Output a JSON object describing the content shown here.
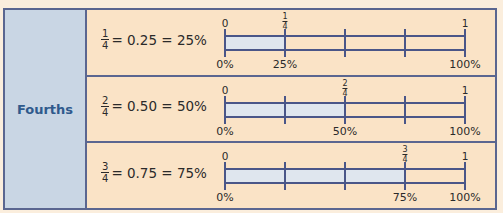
{
  "category_label": "Fourths",
  "rows": [
    {
      "fraction": {
        "num": "1",
        "den": "4"
      },
      "equation": "= 0.25 = 25%",
      "marker": {
        "num": "1",
        "den": "4",
        "percent": "25%"
      },
      "start_label": "0",
      "end_label": "1",
      "start_percent": "0%",
      "end_percent": "100%",
      "shaded_fraction": 0.25
    },
    {
      "fraction": {
        "num": "2",
        "den": "4"
      },
      "equation": "= 0.50 = 50%",
      "marker": {
        "num": "2",
        "den": "4",
        "percent": "50%"
      },
      "start_label": "0",
      "end_label": "1",
      "start_percent": "0%",
      "end_percent": "100%",
      "shaded_fraction": 0.5
    },
    {
      "fraction": {
        "num": "3",
        "den": "4"
      },
      "equation": "= 0.75 = 75%",
      "marker": {
        "num": "3",
        "den": "4",
        "percent": "75%"
      },
      "start_label": "0",
      "end_label": "1",
      "start_percent": "0%",
      "end_percent": "100%",
      "shaded_fraction": 0.75
    }
  ],
  "colors": {
    "background": "#fbeedd",
    "row_background": "#fae3c6",
    "label_column": "#c9d6e4",
    "label_text": "#2f5a8c",
    "border": "#5a6690",
    "shade": "#dfe6ee"
  }
}
